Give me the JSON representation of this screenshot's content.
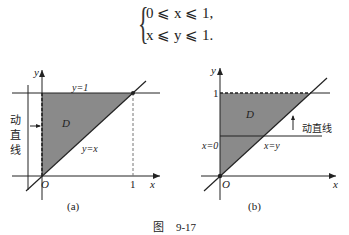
{
  "equation": {
    "line1": "0 ⩽ x ⩽ 1,",
    "line2": "x ⩽ y ⩽ 1."
  },
  "figure_a": {
    "caption": "(a)",
    "axis_x": "x",
    "axis_y": "y",
    "origin": "O",
    "tick_x": "1",
    "line_top": "y=1",
    "line_diag": "y=x",
    "region": "D",
    "moving_line": "动直线"
  },
  "figure_b": {
    "caption": "(b)",
    "axis_x": "x",
    "axis_y": "y",
    "origin": "O",
    "tick_y": "1",
    "line_left": "x=0",
    "line_diag": "x=y",
    "region": "D",
    "moving_line": "动直线"
  },
  "figure_title": {
    "label": "图",
    "number": "9-17"
  },
  "colors": {
    "fill": "#8a8a8a",
    "line": "#222222"
  }
}
